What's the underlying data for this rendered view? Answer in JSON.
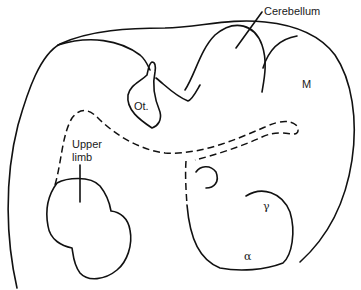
{
  "diagram": {
    "type": "anatomical line drawing",
    "labels": {
      "cerebellum": "Cerebellum",
      "m": "M",
      "otocyst": "Ot.",
      "upper_limb_line1": "Upper",
      "upper_limb_line2": "limb",
      "gamma": "γ",
      "alpha": "α"
    },
    "colors": {
      "line": "#111111",
      "background": "#ffffff"
    }
  }
}
